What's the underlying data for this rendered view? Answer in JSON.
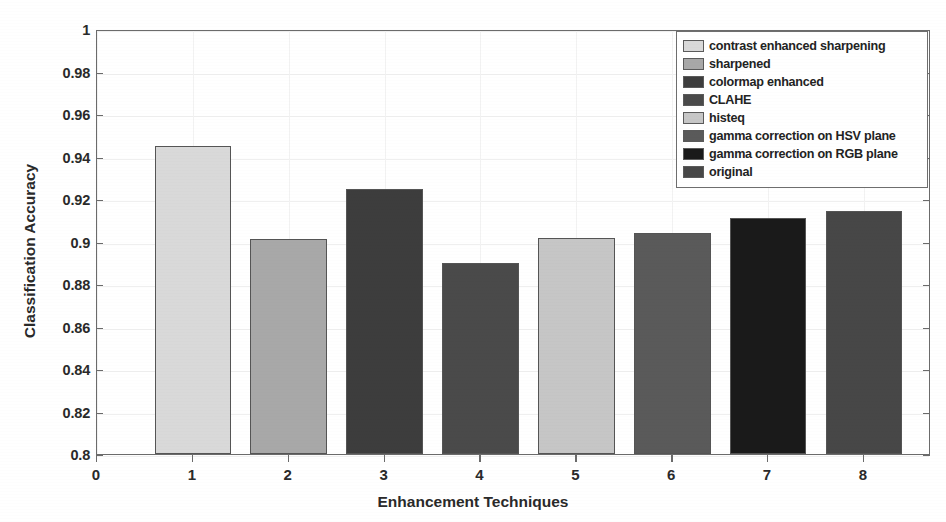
{
  "chart_data": {
    "type": "bar",
    "title": "",
    "xlabel": "Enhancement Techniques",
    "ylabel": "Classification Accuracy",
    "xlim": [
      0,
      8.7
    ],
    "ylim": [
      0.8,
      1
    ],
    "grid": true,
    "legend_position": "top-right",
    "x_tick_labels": [
      "0",
      "1",
      "2",
      "3",
      "4",
      "5",
      "6",
      "7",
      "8"
    ],
    "x_ticks": [
      0,
      1,
      2,
      3,
      4,
      5,
      6,
      7,
      8
    ],
    "y_tick_labels": [
      "1",
      "0.98",
      "0.96",
      "0.94",
      "0.92",
      "0.9",
      "0.88",
      "0.86",
      "0.84",
      "0.82",
      "0.8"
    ],
    "y_ticks": [
      1,
      0.98,
      0.96,
      0.94,
      0.92,
      0.9,
      0.88,
      0.86,
      0.84,
      0.82,
      0.8
    ],
    "categories": [
      1,
      2,
      3,
      4,
      5,
      6,
      7,
      8
    ],
    "values": [
      0.945,
      0.901,
      0.9245,
      0.89,
      0.9015,
      0.904,
      0.911,
      0.9145
    ],
    "bar_colors": [
      "#d9d9d9",
      "#a8a8a8",
      "#3d3d3d",
      "#4a4a4a",
      "#c6c6c6",
      "#5a5a5a",
      "#1a1a1a",
      "#474747"
    ],
    "bar_edge_color": "#555555",
    "series_names": [
      "contrast enhanced sharpening",
      "sharpened",
      "colormap enhanced",
      "CLAHE",
      "histeq",
      "gamma correction on HSV plane",
      "gamma correction on RGB plane",
      "original"
    ]
  },
  "legend": {
    "items": [
      {
        "label": "contrast enhanced sharpening",
        "color": "#d9d9d9"
      },
      {
        "label": "sharpened",
        "color": "#a8a8a8"
      },
      {
        "label": "colormap enhanced",
        "color": "#3d3d3d"
      },
      {
        "label": "CLAHE",
        "color": "#4a4a4a"
      },
      {
        "label": "histeq",
        "color": "#c6c6c6"
      },
      {
        "label": "gamma correction on HSV plane",
        "color": "#5a5a5a"
      },
      {
        "label": "gamma correction on RGB plane",
        "color": "#1a1a1a"
      },
      {
        "label": "original",
        "color": "#474747"
      }
    ]
  },
  "axes": {
    "x_title": "Enhancement Techniques",
    "y_title": "Classification Accuracy"
  }
}
